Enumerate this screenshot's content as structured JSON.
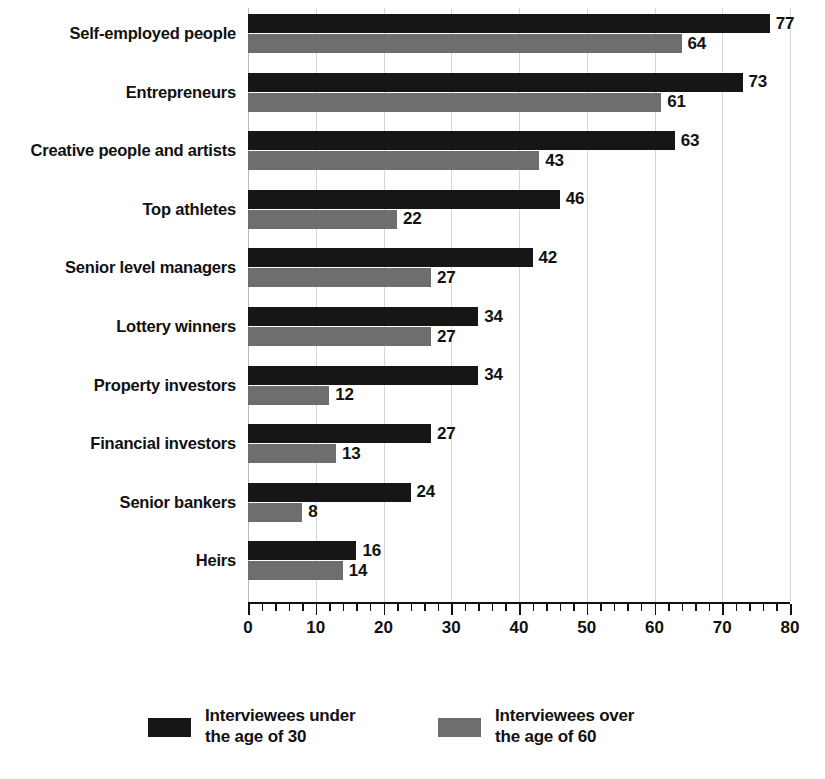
{
  "chart_data": {
    "type": "bar",
    "orientation": "horizontal",
    "title": "",
    "subtitle": "",
    "xlabel": "",
    "ylabel": "",
    "xlim": [
      0,
      80
    ],
    "x_ticks": [
      0,
      10,
      20,
      30,
      40,
      50,
      60,
      70,
      80
    ],
    "x_tick_labels": [
      "0",
      "10",
      "20",
      "30",
      "40",
      "50",
      "60",
      "70",
      "80"
    ],
    "x_minor_tick_step": 2,
    "grid": true,
    "grid_axis": "x",
    "legend_position": "bottom",
    "categories": [
      "Self-employed people",
      "Entrepreneurs",
      "Creative people and artists",
      "Top athletes",
      "Senior level managers",
      "Lottery winners",
      "Property investors",
      "Financial investors",
      "Senior bankers",
      "Heirs"
    ],
    "series": [
      {
        "name": "Interviewees under\nthe age of 30",
        "color": "#161616",
        "values": [
          77,
          73,
          63,
          46,
          42,
          34,
          34,
          27,
          24,
          16
        ]
      },
      {
        "name": "Interviewees over\nthe age of 60",
        "color": "#6e6e6e",
        "values": [
          64,
          61,
          43,
          22,
          27,
          27,
          12,
          13,
          8,
          14
        ]
      }
    ]
  },
  "legend": {
    "items": [
      {
        "label": "Interviewees under\nthe age of 30",
        "color": "#161616"
      },
      {
        "label": "Interviewees over\nthe age of 60",
        "color": "#6e6e6e"
      }
    ]
  },
  "colors": {
    "series_under_30": "#161616",
    "series_over_60": "#6e6e6e",
    "background": "#ffffff",
    "text": "#111111",
    "gridline": "#d7d7d7",
    "axis": "#111111"
  }
}
